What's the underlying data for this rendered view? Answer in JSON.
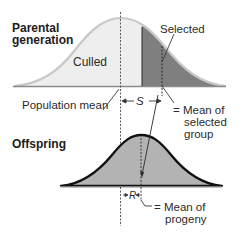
{
  "parental": {
    "title_line1": "Parental",
    "title_line2": "generation",
    "culled_label": "Culled",
    "selected_label": "Selected",
    "population_mean_label": "Population mean",
    "s_label": "S",
    "selected_mean_line1": "= Mean of",
    "selected_mean_line2": "selected",
    "selected_mean_line3": "group"
  },
  "offspring": {
    "title": "Offspring",
    "r_label": "R",
    "progeny_mean_line1": "= Mean of",
    "progeny_mean_line2": "progeny"
  },
  "colors": {
    "culled_fill": "#eeeeee",
    "selected_fill": "#7f7f7f",
    "parental_outline": "#c8c8c8",
    "offspring_fill": "#b3b3b3",
    "offspring_outline": "#111111",
    "baseline": "#8a8a8a"
  }
}
